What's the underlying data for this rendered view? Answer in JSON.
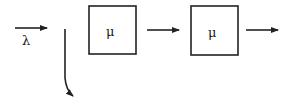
{
  "diagram": {
    "type": "queueing-network",
    "input_rate_label": "λ",
    "servers": [
      {
        "label": "μ"
      },
      {
        "label": "μ"
      }
    ],
    "colors": {
      "stroke": "#222222",
      "background": "#ffffff"
    }
  }
}
